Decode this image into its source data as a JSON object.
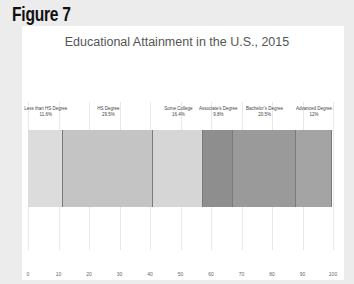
{
  "figure_label": "Figure 7",
  "chart_data": {
    "type": "bar",
    "subtype": "stacked-horizontal-100",
    "title": "Educational Attainment in the U.S., 2015",
    "xlabel": "",
    "ylabel": "",
    "xlim": [
      0,
      100
    ],
    "x_ticks": [
      "0",
      "10",
      "20",
      "30",
      "40",
      "50",
      "60",
      "70",
      "80",
      "90",
      "100"
    ],
    "grid": true,
    "legend": "none",
    "categories": [
      "Less than HS Degree",
      "HS Degree",
      "Some College",
      "Associate's Degree",
      "Bachelor's Degree",
      "Advanced Degree"
    ],
    "values": [
      11.6,
      29.5,
      16.4,
      9.8,
      20.5,
      12
    ],
    "labels": [
      "11.6%",
      "29.5%",
      "16.4%",
      "9.8%",
      "20.5%",
      "12%"
    ],
    "colors": [
      "#dcdcdc",
      "#c4c4c4",
      "#d6d6d6",
      "#8e8e8e",
      "#9a9a9a",
      "#a4a4a4"
    ]
  }
}
